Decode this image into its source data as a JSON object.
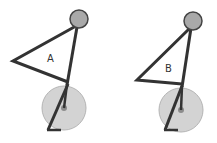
{
  "figures": [
    {
      "label": "A",
      "head": {
        "cx": 79,
        "cy": 19,
        "r": 9
      },
      "apex_left": {
        "x": 13,
        "y": 61
      },
      "joint": {
        "x": 68,
        "y": 82
      },
      "wheel": {
        "cx": 64,
        "cy": 108,
        "r": 22
      },
      "foot": {
        "x1": 48,
        "y1": 130,
        "x2": 61,
        "y2": 130
      },
      "label_pos": {
        "x": 47,
        "y": 62
      }
    },
    {
      "label": "B",
      "head": {
        "cx": 193,
        "cy": 21,
        "r": 9
      },
      "apex_left": {
        "x": 137,
        "y": 80
      },
      "joint": {
        "x": 182,
        "y": 84
      },
      "wheel": {
        "cx": 181,
        "cy": 110,
        "r": 22
      },
      "foot": {
        "x1": 165,
        "y1": 130,
        "x2": 178,
        "y2": 130
      },
      "label_pos": {
        "x": 165,
        "y": 72
      }
    }
  ],
  "colors": {
    "stroke": "#333333",
    "head_fill": "#a9a9a9",
    "wheel_fill": "#d3d3d3",
    "wheel_stroke": "#b5b5b5",
    "hub_fill": "#8c8c8c"
  }
}
